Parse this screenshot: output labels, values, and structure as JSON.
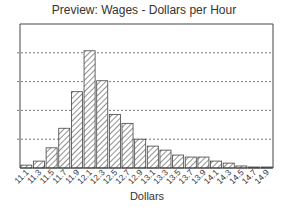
{
  "chart_data": {
    "type": "bar",
    "title": "Preview: Wages - Dollars per Hour",
    "xlabel": "Dollars",
    "ylabel": "",
    "categories": [
      "11.1",
      "11.3",
      "11.5",
      "11.7",
      "11.9",
      "12.1",
      "12.3",
      "12.5",
      "12.7",
      "12.9",
      "13.1",
      "13.3",
      "13.5",
      "13.7",
      "13.9",
      "14.1",
      "14.3",
      "14.5",
      "14.7",
      "14.9"
    ],
    "values": [
      0.1,
      0.24,
      0.7,
      1.38,
      2.65,
      4.07,
      3.03,
      1.86,
      1.55,
      1.0,
      0.76,
      0.62,
      0.45,
      0.38,
      0.38,
      0.24,
      0.17,
      0.07,
      0.03,
      0.03
    ],
    "ylim": [
      0,
      5
    ],
    "y_gridlines": [
      1,
      2,
      3,
      4
    ],
    "y_tick_labels_visible": false,
    "grid": true,
    "grid_style": "dashed horizontal",
    "bar_fill": "diagonal hatch",
    "legend": null
  }
}
